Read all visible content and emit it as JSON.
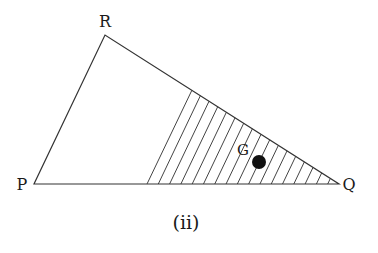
{
  "diagram": {
    "caption": "(ii)",
    "vertices": {
      "P": {
        "label": "P",
        "x": 34,
        "y": 184
      },
      "Q": {
        "label": "Q",
        "x": 339,
        "y": 184
      },
      "R": {
        "label": "R",
        "x": 105,
        "y": 35
      }
    },
    "centroid": {
      "label": "G",
      "x": 259,
      "y": 162
    },
    "shaded_region": {
      "description": "Trapezoid-like region near Q hatched with lines parallel to PR",
      "left_edge_bottom": {
        "x": 147,
        "y": 184
      },
      "left_edge_top": {
        "x": 192,
        "y": 90
      },
      "hatch_count": 17
    },
    "colors": {
      "stroke": "#333333",
      "dot": "#111111"
    }
  }
}
